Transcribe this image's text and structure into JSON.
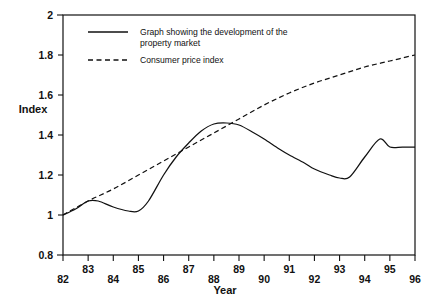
{
  "chart_data": {
    "type": "line",
    "title": "",
    "xlabel": "Year",
    "ylabel": "Index",
    "xlim": [
      82,
      96
    ],
    "ylim": [
      0.8,
      2
    ],
    "grid": false,
    "legend_position": "top-left-inside",
    "x_tick_labels": [
      "82",
      "83",
      "84",
      "85",
      "86",
      "87",
      "88",
      "89",
      "90",
      "91",
      "92",
      "93",
      "94",
      "95",
      "96"
    ],
    "y_tick_labels": [
      "0.8",
      "1",
      "1.2",
      "1.4",
      "1.6",
      "1.8",
      "2"
    ],
    "y_ticks": [
      0.8,
      1,
      1.2,
      1.4,
      1.6,
      1.8,
      2
    ],
    "x_ticks": [
      82,
      83,
      84,
      85,
      86,
      87,
      88,
      89,
      90,
      91,
      92,
      93,
      94,
      95,
      96
    ],
    "series": [
      {
        "name": "Graph showing the development of the property market",
        "style": "solid",
        "x": [
          82,
          82.5,
          83,
          83.4,
          84,
          84.6,
          85,
          85.4,
          86,
          86.5,
          87,
          87.5,
          88,
          88.5,
          89,
          89.6,
          90,
          90.6,
          91,
          91.6,
          92,
          92.6,
          93,
          93.4,
          94,
          94.6,
          95,
          95.5,
          96
        ],
        "values": [
          1.0,
          1.03,
          1.07,
          1.07,
          1.04,
          1.02,
          1.02,
          1.07,
          1.2,
          1.29,
          1.36,
          1.42,
          1.455,
          1.46,
          1.45,
          1.41,
          1.38,
          1.33,
          1.3,
          1.26,
          1.23,
          1.2,
          1.185,
          1.19,
          1.29,
          1.38,
          1.34,
          1.34,
          1.34
        ]
      },
      {
        "name": "Consumer price index",
        "style": "dashed",
        "x": [
          82,
          83,
          84,
          85,
          86,
          87,
          88,
          89,
          90,
          91,
          92,
          93,
          94,
          95,
          96
        ],
        "values": [
          1.0,
          1.07,
          1.13,
          1.2,
          1.27,
          1.34,
          1.41,
          1.48,
          1.55,
          1.61,
          1.66,
          1.7,
          1.74,
          1.77,
          1.8
        ]
      }
    ]
  },
  "legend": {
    "entry_1_line_1": "Graph showing the development of the",
    "entry_1_line_2": "property market",
    "entry_2": "Consumer price index"
  },
  "axes": {
    "y_title": "Index",
    "x_title": "Year"
  }
}
